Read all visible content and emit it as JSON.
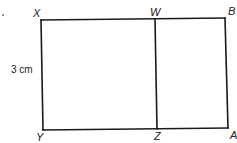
{
  "diagram": {
    "type": "rectangle-divided",
    "points": {
      "X": {
        "label": "X",
        "x": 41,
        "y": 20
      },
      "W": {
        "label": "W",
        "x": 155,
        "y": 19
      },
      "B": {
        "label": "B",
        "x": 225,
        "y": 18
      },
      "Y": {
        "label": "Y",
        "x": 43,
        "y": 130
      },
      "Z": {
        "label": "Z",
        "x": 157,
        "y": 129
      },
      "A": {
        "label": "A",
        "x": 228,
        "y": 128
      }
    },
    "segments": [
      {
        "from": "X",
        "to": "B"
      },
      {
        "from": "B",
        "to": "A"
      },
      {
        "from": "A",
        "to": "Y"
      },
      {
        "from": "Y",
        "to": "X"
      },
      {
        "from": "W",
        "to": "Z"
      }
    ],
    "dimension": {
      "label": "3 cm",
      "side": "XY"
    },
    "marker": "."
  }
}
